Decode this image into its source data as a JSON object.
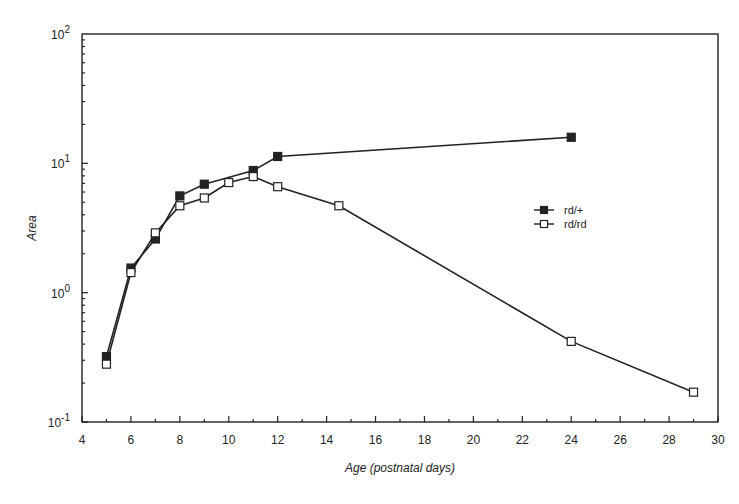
{
  "chart_data": {
    "type": "line",
    "title": "",
    "xlabel": "Age (postnatal days)",
    "ylabel": "Area",
    "xlim": [
      4,
      30
    ],
    "ylim": [
      0.1,
      100
    ],
    "yscale": "log",
    "x_ticks": [
      4,
      6,
      8,
      10,
      12,
      14,
      16,
      18,
      20,
      22,
      24,
      26,
      28,
      30
    ],
    "y_ticks": [
      {
        "value": 0.1,
        "base": "10",
        "exp": "-1"
      },
      {
        "value": 1,
        "base": "10",
        "exp": "0"
      },
      {
        "value": 10,
        "base": "10",
        "exp": "1"
      },
      {
        "value": 100,
        "base": "10",
        "exp": "2"
      }
    ],
    "grid": false,
    "legend_position": "right-middle",
    "series": [
      {
        "name": "rd/+",
        "marker": "filled-square",
        "x": [
          5,
          6,
          7,
          8,
          9,
          11,
          12,
          24
        ],
        "values": [
          0.32,
          1.55,
          2.6,
          5.6,
          6.9,
          8.8,
          11.3,
          15.9
        ]
      },
      {
        "name": "rd/rd",
        "marker": "open-square",
        "x": [
          5,
          6,
          7,
          8,
          9,
          10,
          11,
          12,
          14.5,
          24,
          29
        ],
        "values": [
          0.28,
          1.43,
          2.9,
          4.7,
          5.4,
          7.1,
          7.9,
          6.6,
          4.7,
          0.42,
          0.17
        ]
      }
    ]
  },
  "colors": {
    "line": "#222222",
    "background": "#ffffff"
  }
}
